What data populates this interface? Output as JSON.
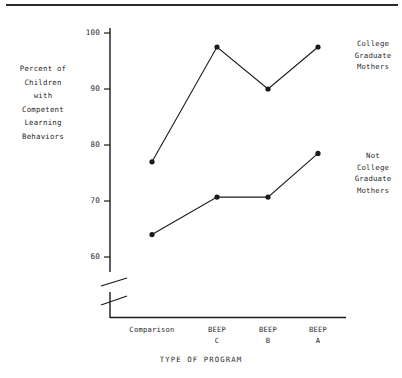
{
  "figure": {
    "y_axis_title_lines": [
      "Percent of",
      "Children",
      "with",
      "Competent",
      "Learning",
      "Behaviors"
    ],
    "x_axis_title": "TYPE OF PROGRAM",
    "annotations": {
      "college": [
        "College",
        "Graduate",
        "Mothers"
      ],
      "not_college": [
        "Not",
        "College",
        "Graduate",
        "Mothers"
      ]
    }
  },
  "chart_data": {
    "type": "line",
    "title": "",
    "xlabel": "TYPE OF PROGRAM",
    "ylabel": "Percent of Children with Competent Learning Behaviors",
    "categories": [
      "Comparison",
      "BEEP C",
      "BEEP B",
      "BEEP A"
    ],
    "category_label_lines": [
      [
        "Comparison"
      ],
      [
        "BEEP",
        "C"
      ],
      [
        "BEEP",
        "B"
      ],
      [
        "BEEP",
        "A"
      ]
    ],
    "series": [
      {
        "name": "College Graduate Mothers",
        "values": [
          77,
          97.5,
          90,
          97.5
        ]
      },
      {
        "name": "Not College Graduate Mothers",
        "values": [
          64,
          70.7,
          70.7,
          78.5
        ]
      }
    ],
    "yticks": [
      60,
      70,
      80,
      90,
      100
    ],
    "ylim": [
      60,
      100
    ],
    "axis_break": true,
    "grid": false,
    "legend": "annotated-right",
    "marker": "filled-circle",
    "line_color": "#1a1a1a"
  }
}
